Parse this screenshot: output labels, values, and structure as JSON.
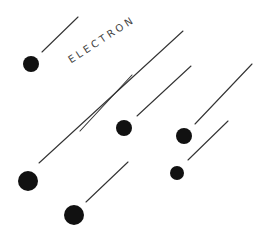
{
  "diagram": {
    "title": "",
    "label": "ELECTRON",
    "colors": {
      "background": "#ffffff",
      "dot": "#111111",
      "line": "#333333",
      "text": "#444444"
    },
    "electrons": [
      {
        "cx": 31,
        "cy": 64,
        "r": 8,
        "trail": {
          "x1": 42,
          "y1": 52,
          "x2": 78,
          "y2": 17
        }
      },
      {
        "cx": 124,
        "cy": 128,
        "r": 8,
        "trail": {
          "x1": 137,
          "y1": 116,
          "x2": 191,
          "y2": 66
        }
      },
      {
        "cx": 184,
        "cy": 136,
        "r": 8,
        "trail": {
          "x1": 195,
          "y1": 124,
          "x2": 252,
          "y2": 64
        }
      },
      {
        "cx": 177,
        "cy": 173,
        "r": 7,
        "trail": {
          "x1": 188,
          "y1": 160,
          "x2": 228,
          "y2": 121
        }
      },
      {
        "cx": 28,
        "cy": 181,
        "r": 10,
        "trail": {
          "x1": 39,
          "y1": 163,
          "x2": 183,
          "y2": 31
        }
      },
      {
        "cx": 74,
        "cy": 215,
        "r": 10,
        "trail": {
          "x1": 86,
          "y1": 202,
          "x2": 128,
          "y2": 162
        }
      }
    ],
    "extra_lines": [
      {
        "x1": 80,
        "y1": 131,
        "x2": 132,
        "y2": 75
      }
    ]
  }
}
